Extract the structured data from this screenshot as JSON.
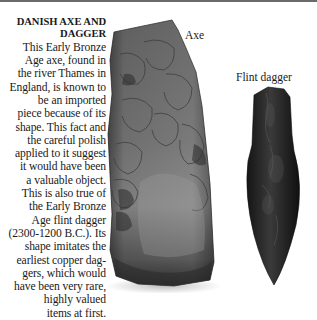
{
  "caption": {
    "title_lines": [
      "DANISH AXE AND",
      "DAGGER"
    ],
    "body_lines": [
      "This Early Bronze",
      "Age axe, found in",
      "the river Thames in",
      "England, is known to",
      "be an imported",
      "piece because of its",
      "shape. This fact and",
      "the careful polish",
      "applied to it suggest",
      "it would have been",
      "a valuable object.",
      "This is also true of",
      "the Early Bronze",
      "Age flint dagger",
      "(2300-1200 B.C.). Its",
      "shape imitates the",
      "earliest copper dag-",
      "gers, which would",
      "have been very rare,",
      "highly valued",
      "items at first."
    ]
  },
  "labels": {
    "axe": "Axe",
    "dagger": "Flint dagger"
  },
  "images": {
    "axe": "stone-axe-photo",
    "dagger": "flint-dagger-photo"
  },
  "colors": {
    "axe_light": "#8e8e8e",
    "axe_mid": "#5f5f5f",
    "axe_dark": "#2e2e2e",
    "dagger_dark": "#1e1e1e",
    "dagger_mid": "#3a3a3a",
    "top_rule": "#6a6a6a"
  }
}
